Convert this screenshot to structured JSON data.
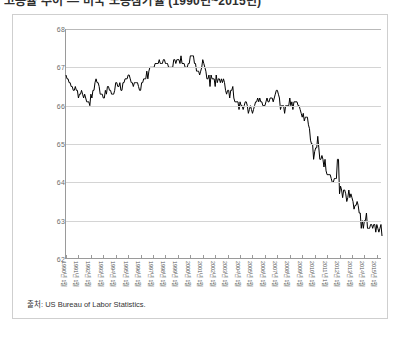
{
  "heading": "고용률 추이 — 미국 노동참가율 (1990년~2015년)",
  "card": {
    "source_label": "출처: US Bureau of Labor Statistics."
  },
  "chart_data": {
    "type": "line",
    "title": "",
    "xlabel": "",
    "ylabel": "",
    "ylim": [
      62,
      68
    ],
    "yticks": [
      62,
      63,
      64,
      65,
      66,
      67,
      68
    ],
    "grid": true,
    "legend": "none",
    "series_color": "#000000",
    "x_tick_labels": [
      "1990년 1월",
      "1991년 1월",
      "1992년 1월",
      "1993년 1월",
      "1994년 1월",
      "1995년 1월",
      "1996년 1월",
      "1997년 1월",
      "1998년 1월",
      "1999년 1월",
      "2000년 1월",
      "2001년 1월",
      "2002년 1월",
      "2003년 1월",
      "2004년 1월",
      "2005년 1월",
      "2006년 1월",
      "2007년 1월",
      "2008년 1월",
      "2009년 1월",
      "2010년 1월",
      "2011년 1월",
      "2012년 1월",
      "2013년 1월",
      "2014년 1월",
      "2015년 1월"
    ],
    "x_start": "1990-01",
    "x_end": "2015-06",
    "frequency": "monthly",
    "series": [
      {
        "name": "Labor Force Participation Rate",
        "values": [
          66.8,
          66.7,
          66.7,
          66.6,
          66.6,
          66.5,
          66.5,
          66.4,
          66.4,
          66.5,
          66.4,
          66.4,
          66.2,
          66.3,
          66.3,
          66.4,
          66.3,
          66.2,
          66.3,
          66.2,
          66.1,
          66.1,
          66.1,
          66.0,
          66.3,
          66.2,
          66.4,
          66.4,
          66.6,
          66.7,
          66.6,
          66.6,
          66.5,
          66.3,
          66.3,
          66.3,
          66.2,
          66.2,
          66.4,
          66.3,
          66.5,
          66.5,
          66.4,
          66.4,
          66.3,
          66.3,
          66.3,
          66.4,
          66.6,
          66.6,
          66.5,
          66.5,
          66.6,
          66.4,
          66.4,
          66.6,
          66.6,
          66.7,
          66.7,
          66.7,
          66.8,
          66.8,
          66.7,
          66.6,
          66.6,
          66.5,
          66.6,
          66.6,
          66.6,
          66.6,
          66.5,
          66.4,
          66.4,
          66.6,
          66.6,
          66.7,
          66.7,
          66.7,
          66.9,
          66.7,
          66.9,
          67.0,
          67.0,
          67.0,
          67.0,
          67.0,
          67.1,
          67.1,
          67.1,
          67.1,
          67.2,
          67.1,
          67.1,
          67.1,
          67.2,
          67.2,
          67.1,
          67.1,
          67.1,
          67.0,
          67.0,
          67.0,
          67.0,
          67.0,
          67.2,
          67.2,
          67.1,
          67.2,
          67.2,
          67.2,
          67.1,
          67.3,
          67.1,
          67.1,
          67.1,
          67.0,
          67.0,
          67.0,
          67.1,
          67.1,
          67.3,
          67.3,
          67.3,
          67.3,
          67.1,
          67.1,
          66.9,
          66.9,
          66.9,
          66.8,
          66.9,
          67.0,
          67.2,
          67.1,
          67.0,
          66.9,
          66.7,
          66.7,
          66.8,
          66.5,
          66.8,
          66.7,
          66.7,
          66.7,
          66.5,
          66.8,
          66.6,
          66.7,
          66.7,
          66.6,
          66.7,
          66.6,
          66.7,
          66.6,
          66.4,
          66.3,
          66.4,
          66.4,
          66.2,
          66.4,
          66.4,
          66.5,
          66.2,
          66.1,
          66.1,
          66.1,
          66.1,
          65.9,
          66.1,
          66.0,
          66.0,
          65.9,
          66.0,
          66.1,
          66.1,
          66.0,
          65.8,
          65.9,
          66.0,
          65.9,
          65.8,
          65.9,
          66.0,
          66.1,
          66.1,
          66.2,
          66.1,
          66.2,
          66.1,
          66.1,
          66.0,
          66.0,
          66.0,
          66.1,
          66.2,
          66.1,
          66.1,
          66.2,
          66.2,
          66.2,
          66.1,
          66.2,
          66.3,
          66.4,
          66.4,
          66.3,
          66.2,
          65.9,
          66.0,
          66.0,
          66.0,
          65.8,
          66.0,
          66.0,
          66.0,
          66.0,
          66.2,
          66.0,
          66.1,
          65.9,
          66.1,
          66.1,
          66.1,
          66.1,
          66.0,
          66.0,
          65.9,
          65.8,
          65.7,
          65.8,
          65.6,
          65.7,
          65.7,
          65.7,
          65.5,
          65.4,
          65.1,
          65.0,
          65.0,
          64.6,
          64.8,
          64.9,
          64.9,
          65.2,
          64.9,
          64.6,
          64.6,
          64.7,
          64.6,
          64.4,
          64.6,
          64.3,
          64.2,
          64.2,
          64.2,
          64.2,
          64.1,
          64.0,
          64.0,
          64.1,
          64.1,
          64.1,
          64.6,
          64.6,
          63.7,
          63.9,
          63.8,
          63.6,
          63.8,
          63.8,
          63.7,
          63.5,
          63.6,
          63.8,
          63.6,
          63.7,
          63.6,
          63.5,
          63.3,
          63.4,
          63.4,
          63.5,
          63.4,
          63.2,
          63.2,
          62.8,
          63.0,
          62.8,
          63.0,
          63.0,
          63.2,
          62.8,
          62.8,
          62.8,
          62.9,
          62.9,
          62.8,
          62.9,
          62.9,
          62.7,
          62.9,
          62.8,
          62.7,
          62.8,
          62.9,
          62.6
        ]
      }
    ]
  }
}
